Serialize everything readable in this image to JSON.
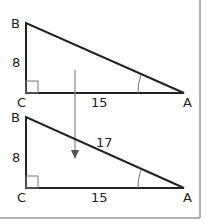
{
  "colors": {
    "line": "#222222",
    "frame": "#999999",
    "arrow": "#8a8a8a",
    "arc": "#777777"
  },
  "diagram": {
    "top_triangle": {
      "vertices": {
        "B": "B",
        "C": "C",
        "A": "A"
      },
      "side_BC": "8",
      "side_CA": "15",
      "right_angle_at": "C",
      "angle_marked_at": "A"
    },
    "bottom_triangle": {
      "vertices": {
        "B": "B",
        "C": "C",
        "A": "A"
      },
      "side_BC": "8",
      "side_CA": "15",
      "side_AB": "17",
      "right_angle_at": "C",
      "angle_marked_at": "A"
    },
    "arrow": "down-arrow"
  }
}
